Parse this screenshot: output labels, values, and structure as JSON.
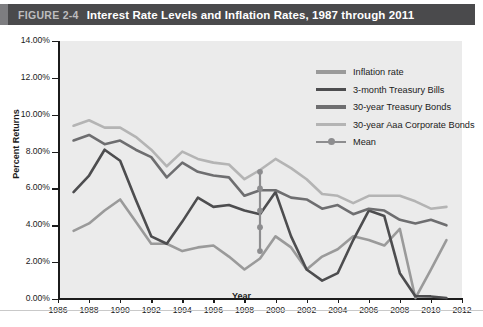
{
  "header": {
    "figure_number": "FIGURE 2-4",
    "title": "Interest Rate Levels and Inflation Rates, 1987 through 2011"
  },
  "colors": {
    "inflation": "#9a9a9a",
    "tbills": "#4d4d4f",
    "treasury_bonds": "#6e6e70",
    "corporate_bonds": "#b4b4b4",
    "mean": "#8d8d8f",
    "plot_background": "#ebebeb",
    "axis": "#1b1b1b",
    "header_bar": "#4a4a4c"
  },
  "legend": {
    "position": "top-right",
    "items": [
      {
        "label": "Inflation rate",
        "color_key": "inflation",
        "icon": "line-swatch"
      },
      {
        "label": "3-month Treasury Bills",
        "color_key": "tbills",
        "icon": "line-swatch"
      },
      {
        "label": "30-year Treasury Bonds",
        "color_key": "treasury_bonds",
        "icon": "line-swatch"
      },
      {
        "label": "30-year Aaa Corporate Bonds",
        "color_key": "corporate_bonds",
        "icon": "line-swatch"
      },
      {
        "label": "Mean",
        "color_key": "mean",
        "icon": "line-marker-swatch"
      }
    ]
  },
  "chart_data": {
    "type": "line",
    "title": "Interest Rate Levels and Inflation Rates, 1987 through 2011",
    "xlabel": "Year",
    "ylabel": "Percent Returns",
    "xlim": [
      1986,
      2012
    ],
    "ylim": [
      0,
      14
    ],
    "ytick_labels": [
      "0.00%",
      "2.00%",
      "4.00%",
      "6.00%",
      "8.00%",
      "10.00%",
      "12.00%",
      "14.00%"
    ],
    "ytick_values": [
      0,
      2,
      4,
      6,
      8,
      10,
      12,
      14
    ],
    "xtick_labels": [
      "1986",
      "1988",
      "1990",
      "1992",
      "1994",
      "1996",
      "1998",
      "2000",
      "2002",
      "2004",
      "2006",
      "2008",
      "2010",
      "2012"
    ],
    "xtick_values": [
      1986,
      1988,
      1990,
      1992,
      1994,
      1996,
      1998,
      2000,
      2002,
      2004,
      2006,
      2008,
      2010,
      2012
    ],
    "grid": false,
    "x": [
      1987,
      1988,
      1989,
      1990,
      1991,
      1992,
      1993,
      1994,
      1995,
      1996,
      1997,
      1998,
      1999,
      2000,
      2001,
      2002,
      2003,
      2004,
      2005,
      2006,
      2007,
      2008,
      2009,
      2010,
      2011
    ],
    "series": [
      {
        "name": "Inflation rate",
        "color_key": "inflation",
        "values": [
          3.7,
          4.1,
          4.8,
          5.4,
          4.2,
          3.0,
          3.0,
          2.6,
          2.8,
          2.9,
          2.3,
          1.6,
          2.2,
          3.4,
          2.8,
          1.6,
          2.3,
          2.7,
          3.4,
          3.2,
          2.9,
          3.8,
          0.05,
          1.6,
          3.2
        ]
      },
      {
        "name": "3-month Treasury Bills",
        "color_key": "tbills",
        "values": [
          5.8,
          6.7,
          8.1,
          7.5,
          5.4,
          3.4,
          3.0,
          4.2,
          5.5,
          5.0,
          5.1,
          4.8,
          4.6,
          5.8,
          3.4,
          1.6,
          1.0,
          1.4,
          3.2,
          4.8,
          4.5,
          1.4,
          0.15,
          0.14,
          0.05
        ]
      },
      {
        "name": "30-year Treasury Bonds",
        "color_key": "treasury_bonds",
        "values": [
          8.6,
          8.9,
          8.4,
          8.6,
          8.1,
          7.7,
          6.6,
          7.4,
          6.9,
          6.7,
          6.6,
          5.6,
          5.9,
          5.9,
          5.5,
          5.4,
          4.9,
          5.1,
          4.6,
          4.9,
          4.8,
          4.3,
          4.1,
          4.3,
          4.0
        ]
      },
      {
        "name": "30-year Aaa Corporate Bonds",
        "color_key": "corporate_bonds",
        "values": [
          9.4,
          9.7,
          9.3,
          9.3,
          8.8,
          8.1,
          7.2,
          8.0,
          7.6,
          7.4,
          7.3,
          6.5,
          7.0,
          7.6,
          7.1,
          6.5,
          5.7,
          5.6,
          5.2,
          5.6,
          5.6,
          5.6,
          5.3,
          4.9,
          5.0
        ]
      }
    ],
    "mean_marker": {
      "name": "Mean",
      "x": 1999,
      "color_key": "mean",
      "points": [
        2.6,
        3.9,
        4.8,
        6.0,
        6.9
      ]
    }
  }
}
